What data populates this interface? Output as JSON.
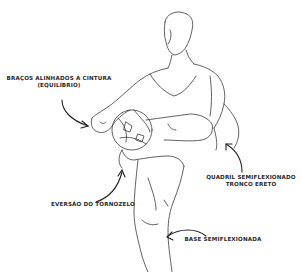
{
  "figure": {
    "type": "annotated line-art illustration",
    "line_color": "#3a3a3a",
    "arrow_color": "#222222",
    "background": "#ffffff"
  },
  "annotations": [
    {
      "id": "arms",
      "lines": [
        "BRAÇOS ALINHADOS À CINTURA",
        "(EQUILÍBRIO)"
      ],
      "points_to": "left hand / waist"
    },
    {
      "id": "hip",
      "lines": [
        "QUADRIL SEMIFLEXIONADO",
        "TRONCO ERETO"
      ],
      "points_to": "right hip / torso"
    },
    {
      "id": "ankle",
      "lines": [
        "EVERSÃO DO TORNOZELO"
      ],
      "points_to": "raised knee / ankle"
    },
    {
      "id": "base",
      "lines": [
        "BASE SEMIFLEXIONADA"
      ],
      "points_to": "standing leg"
    }
  ]
}
